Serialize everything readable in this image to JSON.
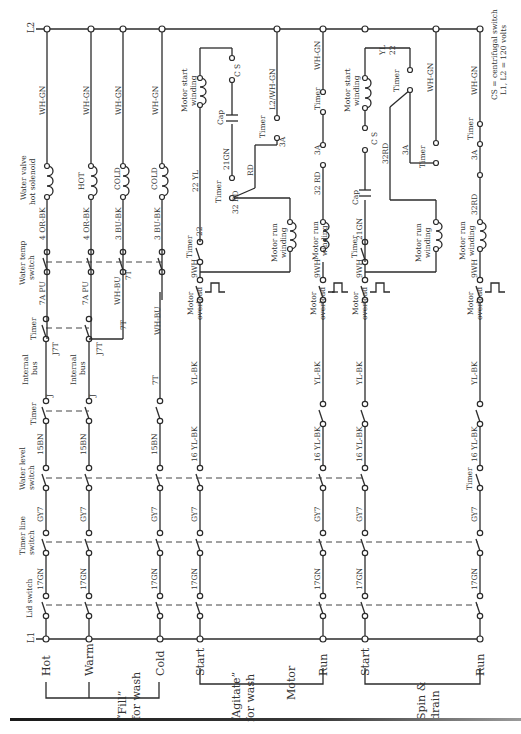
{
  "buses": {
    "l1": "L1",
    "l2": "L2"
  },
  "note": {
    "line1": "CS = centrifugal switch",
    "line2": "L1, L2 = 120 volts"
  },
  "rungs": {
    "hot": "Hot",
    "warm": "Warm",
    "cold": "Cold",
    "agitate_start": "Start",
    "agitate_run": "Run",
    "spin_start": "Start",
    "spin_run": "Run"
  },
  "groups": {
    "fill_1": "“Fill”",
    "fill_2": "for wash",
    "agitate_1": "“Agitate”",
    "agitate_2": "for wash",
    "motor": "Motor",
    "spin_1": "Spin &",
    "spin_2": "drain"
  },
  "components": {
    "lid_switch": "Lid switch",
    "timer_line_1": "Timer line",
    "timer_line_2": "switch",
    "water_level_1": "Water level",
    "water_level_2": "switch",
    "timer": "Timer",
    "internal_bus_1": "Internal",
    "internal_bus_2": "bus",
    "water_temp_1": "Water temp",
    "water_temp_2": "switch",
    "valve_1": "Water valve",
    "valve_2": "hot solenoid",
    "valve_hot": "HOT",
    "valve_cold": "COLD",
    "motor_overload_1": "Motor",
    "motor_overload_2": "overload",
    "motor_run_1": "Motor run",
    "motor_run_2": "winding",
    "motor_start_1": "Motor start",
    "motor_start_2": "winding",
    "cap": "Cap",
    "cs": "C S"
  },
  "wires": {
    "w17gn": "17GN",
    "gy7": "GY7",
    "bn15": "15BN",
    "ylbk16": "16 YL-BK",
    "ylbk": "YL-BK",
    "j": "J",
    "j7t": "J7T",
    "t7": "7T",
    "pu7a": "7A PU",
    "whbu": "WH-BU",
    "orbk4": "4 OR-BK",
    "bubk3": "3 BU-BK",
    "whgn": "WH-GN",
    "wh9": "9WH",
    "n22": "22",
    "yl22": "22 YL",
    "gn21": "21GN",
    "rd": "RD",
    "rd32": "32 RD",
    "rd32b": "32RD",
    "rd32c": "32\nRD",
    "a3": "3A",
    "l2whgn": "L2/WH-GN",
    "yl": "YL"
  }
}
